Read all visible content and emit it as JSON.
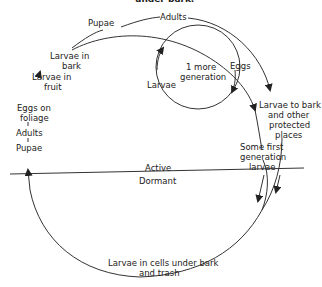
{
  "diagram": {
    "title_partial": "under bark.",
    "phase_labels": {
      "active": "Active",
      "dormant": "Dormant"
    },
    "nodes": {
      "pupae_top": "Pupae",
      "adults_top": "Adults",
      "larvae_in_bark_1": "Larvae in",
      "larvae_in_bark_2": "bark",
      "larvae_in_fruit_1": "Larvae in",
      "larvae_in_fruit_2": "fruit",
      "eggs_on_foliage_1": "Eggs on",
      "eggs_on_foliage_2": "foliage",
      "adults_left": "Adults",
      "pupae_left": "Pupae",
      "one_more_gen_1": "1 more",
      "one_more_gen_2": "generation",
      "eggs": "Eggs",
      "larvae_loop": "Larvae",
      "larvae_to_bark_1": "Larvae to bark",
      "larvae_to_bark_2": "and other",
      "larvae_to_bark_3": "protected",
      "larvae_to_bark_4": "places",
      "some_first_gen_1": "Some first",
      "some_first_gen_2": "generation",
      "some_first_gen_3": "larvae",
      "cells_1": "Larvae in cells under bark",
      "cells_2": "and trash"
    }
  }
}
